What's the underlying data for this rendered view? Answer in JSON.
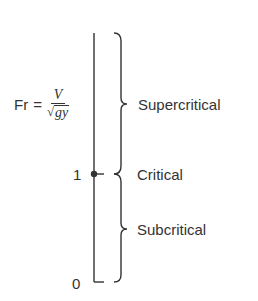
{
  "diagram": {
    "formula": {
      "lhs": "Fr",
      "equals": "=",
      "numerator": "V",
      "sqrt_symbol": "√",
      "radicand": "gy"
    },
    "axis": {
      "ticks": [
        {
          "label": "1",
          "value": 1
        },
        {
          "label": "0",
          "value": 0
        }
      ]
    },
    "regions": [
      {
        "label": "Supercritical",
        "range": "Fr > 1"
      },
      {
        "label": "Critical",
        "range": "Fr = 1"
      },
      {
        "label": "Subcritical",
        "range": "0 ≤ Fr < 1"
      }
    ],
    "colors": {
      "ink": "#333333",
      "background": "#ffffff"
    }
  }
}
